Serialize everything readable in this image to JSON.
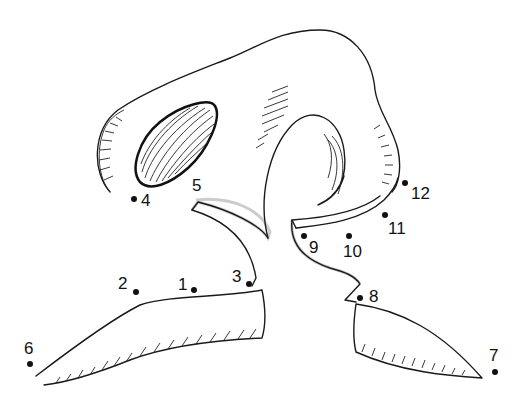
{
  "illustration": {
    "subject": "nose",
    "type": "connect-the-dots"
  },
  "points": [
    {
      "n": "1",
      "x": 194,
      "y": 290,
      "lx": 178,
      "ly": 290
    },
    {
      "n": "2",
      "x": 136,
      "y": 292,
      "lx": 119,
      "ly": 289
    },
    {
      "n": "3",
      "x": 249,
      "y": 284,
      "lx": 232,
      "ly": 281
    },
    {
      "n": "4",
      "x": 134,
      "y": 199,
      "lx": 142,
      "ly": 206
    },
    {
      "n": "5",
      "x": 0,
      "y": 0,
      "lx": 192,
      "ly": 191
    },
    {
      "n": "6",
      "x": 30,
      "y": 364,
      "lx": 25,
      "ly": 355
    },
    {
      "n": "7",
      "x": 495,
      "y": 372,
      "lx": 489,
      "ly": 362
    },
    {
      "n": "8",
      "x": 360,
      "y": 298,
      "lx": 369,
      "ly": 302
    },
    {
      "n": "9",
      "x": 304,
      "y": 236,
      "lx": 309,
      "ly": 253
    },
    {
      "n": "10",
      "x": 349,
      "y": 236,
      "lx": 343,
      "ly": 257
    },
    {
      "n": "11",
      "x": 385,
      "y": 215,
      "lx": 388,
      "ly": 234
    },
    {
      "n": "12",
      "x": 405,
      "y": 183,
      "lx": 411,
      "ly": 199
    }
  ]
}
